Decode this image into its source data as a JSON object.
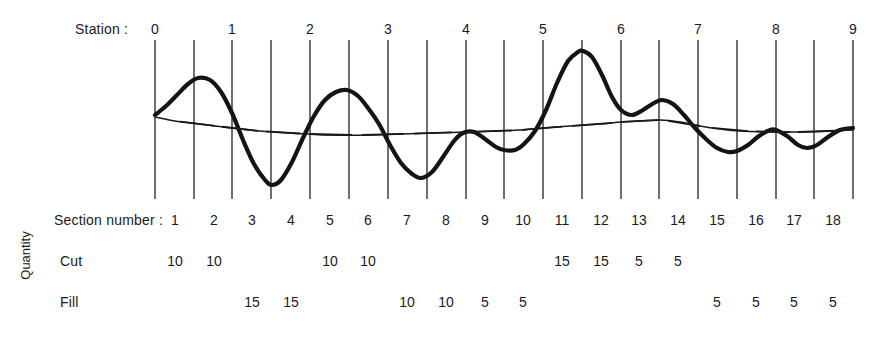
{
  "labels": {
    "station_row": "Station :",
    "section_row": "Section number :",
    "quantity_axis": "Quantity",
    "cut_row": "Cut",
    "fill_row": "Fill"
  },
  "colors": {
    "ink": "#1a1a1a",
    "curve": "#141414",
    "grid": "#333333",
    "balance_line": "#1a1a1a",
    "background": "#ffffff"
  },
  "stations": {
    "values": [
      "0",
      "1",
      "2",
      "3",
      "4",
      "5",
      "6",
      "7",
      "8",
      "9"
    ],
    "x": [
      155,
      232,
      310,
      388,
      466,
      543,
      621,
      698,
      776,
      853
    ]
  },
  "sections": {
    "values": [
      "1",
      "2",
      "3",
      "4",
      "5",
      "6",
      "7",
      "8",
      "9",
      "10",
      "11",
      "12",
      "13",
      "14",
      "15",
      "16",
      "17",
      "18"
    ],
    "x": [
      175,
      214,
      252,
      291,
      330,
      368,
      407,
      446,
      485,
      523,
      562,
      601,
      639,
      678,
      717,
      756,
      794,
      833
    ]
  },
  "grid_ticks": {
    "x": [
      155,
      194,
      232,
      271,
      310,
      349,
      388,
      427,
      466,
      504,
      543,
      582,
      621,
      659,
      698,
      737,
      776,
      814,
      853
    ],
    "top": 40,
    "bottom": 199
  },
  "chart_data": {
    "type": "line",
    "xlabel": "Station",
    "ylabel": "Quantity",
    "grid": true,
    "legend": "none",
    "baseline_y": 128,
    "series": [
      {
        "name": "mass-haul-curve",
        "style": "thick-solid",
        "points": [
          [
            155,
            115
          ],
          [
            166,
            106
          ],
          [
            177,
            95
          ],
          [
            188,
            84
          ],
          [
            198,
            78
          ],
          [
            210,
            80
          ],
          [
            221,
            92
          ],
          [
            232,
            113
          ],
          [
            243,
            140
          ],
          [
            254,
            164
          ],
          [
            265,
            180
          ],
          [
            272,
            185
          ],
          [
            281,
            180
          ],
          [
            292,
            162
          ],
          [
            303,
            138
          ],
          [
            314,
            116
          ],
          [
            325,
            100
          ],
          [
            336,
            92
          ],
          [
            347,
            90
          ],
          [
            358,
            96
          ],
          [
            368,
            108
          ],
          [
            379,
            124
          ],
          [
            390,
            145
          ],
          [
            401,
            163
          ],
          [
            412,
            174
          ],
          [
            421,
            178
          ],
          [
            432,
            172
          ],
          [
            443,
            157
          ],
          [
            454,
            141
          ],
          [
            463,
            133
          ],
          [
            474,
            132
          ],
          [
            485,
            139
          ],
          [
            496,
            147
          ],
          [
            504,
            150
          ],
          [
            515,
            150
          ],
          [
            524,
            144
          ],
          [
            535,
            131
          ],
          [
            546,
            110
          ],
          [
            557,
            83
          ],
          [
            568,
            61
          ],
          [
            578,
            52
          ],
          [
            583,
            51
          ],
          [
            592,
            57
          ],
          [
            602,
            75
          ],
          [
            612,
            97
          ],
          [
            621,
            110
          ],
          [
            632,
            115
          ],
          [
            643,
            110
          ],
          [
            654,
            103
          ],
          [
            662,
            100
          ],
          [
            673,
            104
          ],
          [
            684,
            115
          ],
          [
            695,
            128
          ],
          [
            706,
            139
          ],
          [
            717,
            148
          ],
          [
            728,
            152
          ],
          [
            737,
            151
          ],
          [
            748,
            145
          ],
          [
            759,
            136
          ],
          [
            770,
            130
          ],
          [
            776,
            130
          ],
          [
            787,
            136
          ],
          [
            798,
            145
          ],
          [
            807,
            148
          ],
          [
            817,
            145
          ],
          [
            828,
            137
          ],
          [
            840,
            130
          ],
          [
            853,
            128
          ]
        ]
      },
      {
        "name": "balance-line",
        "style": "thin-dashed",
        "points": [
          [
            155,
            117
          ],
          [
            175,
            121
          ],
          [
            200,
            124
          ],
          [
            232,
            128
          ],
          [
            260,
            131
          ],
          [
            290,
            133
          ],
          [
            330,
            135
          ],
          [
            370,
            135
          ],
          [
            400,
            134
          ],
          [
            430,
            133
          ],
          [
            466,
            132
          ],
          [
            500,
            131
          ],
          [
            520,
            130
          ],
          [
            543,
            128
          ],
          [
            570,
            126
          ],
          [
            600,
            124
          ],
          [
            621,
            122
          ],
          [
            640,
            121
          ],
          [
            660,
            120
          ],
          [
            680,
            122
          ],
          [
            700,
            126
          ],
          [
            720,
            129
          ],
          [
            740,
            131
          ],
          [
            776,
            132
          ],
          [
            800,
            132
          ],
          [
            830,
            131
          ],
          [
            853,
            130
          ]
        ],
        "dash_segments": [
          [
            180,
            215
          ],
          [
            222,
            258
          ],
          [
            266,
            300
          ],
          [
            310,
            352
          ],
          [
            362,
            404
          ],
          [
            414,
            452
          ],
          [
            470,
            512
          ],
          [
            522,
            562
          ],
          [
            572,
            612
          ],
          [
            622,
            658
          ],
          [
            668,
            700
          ],
          [
            712,
            748
          ],
          [
            756,
            790
          ],
          [
            798,
            836
          ]
        ]
      }
    ],
    "quantities": {
      "cut": {
        "label": "Cut",
        "entries": [
          {
            "section": 1,
            "value": "10"
          },
          {
            "section": 2,
            "value": "10"
          },
          {
            "section": 5,
            "value": "10"
          },
          {
            "section": 6,
            "value": "10"
          },
          {
            "section": 11,
            "value": "15"
          },
          {
            "section": 12,
            "value": "15"
          },
          {
            "section": 13,
            "value": "5"
          },
          {
            "section": 14,
            "value": "5"
          }
        ]
      },
      "fill": {
        "label": "Fill",
        "entries": [
          {
            "section": 3,
            "value": "15"
          },
          {
            "section": 4,
            "value": "15"
          },
          {
            "section": 7,
            "value": "10"
          },
          {
            "section": 8,
            "value": "10"
          },
          {
            "section": 9,
            "value": "5"
          },
          {
            "section": 10,
            "value": "5"
          },
          {
            "section": 15,
            "value": "5"
          },
          {
            "section": 16,
            "value": "5"
          },
          {
            "section": 17,
            "value": "5"
          },
          {
            "section": 18,
            "value": "5"
          }
        ]
      }
    }
  }
}
